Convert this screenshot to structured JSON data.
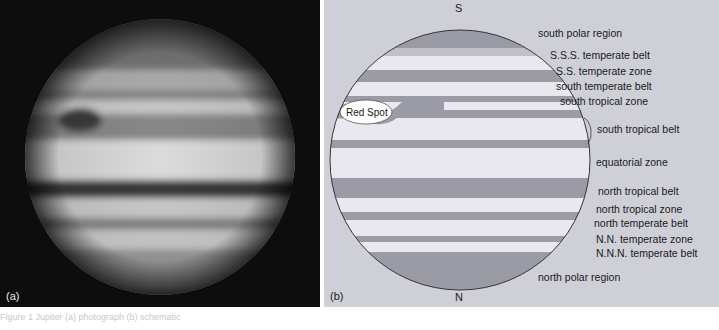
{
  "figure": {
    "panels": [
      {
        "id": "a",
        "label": "(a)",
        "type": "photograph",
        "subject": "Jupiter"
      },
      {
        "id": "b",
        "label": "(b)",
        "type": "schematic"
      }
    ]
  },
  "diagram": {
    "poles": {
      "top": "S",
      "bottom": "N"
    },
    "red_spot_label": "Red Spot",
    "zones": [
      {
        "name": "south polar region"
      },
      {
        "name": "S.S.S. temperate belt"
      },
      {
        "name": "S.S. temperate zone"
      },
      {
        "name": "south temperate belt"
      },
      {
        "name": "south tropical zone"
      },
      {
        "name": "south tropical belt"
      },
      {
        "name": "equatorial zone"
      },
      {
        "name": "north tropical belt"
      },
      {
        "name": "north tropical zone"
      },
      {
        "name": "north temperate belt"
      },
      {
        "name": "N.N. temperate zone"
      },
      {
        "name": "N.N.N. temperate belt"
      },
      {
        "name": "north polar region"
      }
    ],
    "colors": {
      "background": "#cfcfd8",
      "belt": "#9b9ba6",
      "zone": "#e8e8ee",
      "outline": "#333333"
    }
  },
  "caption": "Figure 1 Jupiter (a) photograph (b) schematic"
}
